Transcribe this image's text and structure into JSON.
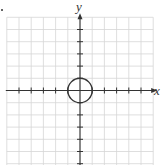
{
  "chart_data": {
    "type": "line",
    "title": "",
    "xlabel": "x",
    "ylabel": "y",
    "xlim": [
      -6,
      6
    ],
    "ylim": [
      -6,
      6
    ],
    "grid": true,
    "ticks_labeled": false,
    "tick_step": 1,
    "series": [
      {
        "name": "circle",
        "equation": "x^2 + y^2 = 1",
        "center": [
          0,
          0
        ],
        "radius": 1
      }
    ]
  },
  "colors": {
    "grid": "#d6d6d6",
    "axis": "#333333",
    "curve": "#333333"
  }
}
